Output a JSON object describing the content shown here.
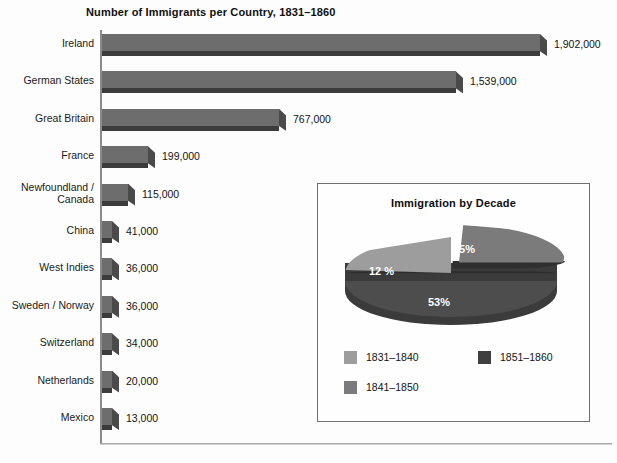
{
  "chart_data": [
    {
      "type": "bar",
      "orientation": "horizontal",
      "title": "Number of Immigrants per Country, 1831–1860",
      "xlabel": "",
      "ylabel": "",
      "grid": false,
      "legend": "none",
      "xlim": [
        0,
        1902000
      ],
      "categories": [
        "Ireland",
        "German States",
        "Great Britain",
        "France",
        "Newfoundland /\nCanada",
        "China",
        "West Indies",
        "Sweden / Norway",
        "Switzerland",
        "Netherlands",
        "Mexico"
      ],
      "values": [
        1902000,
        1539000,
        767000,
        199000,
        115000,
        41000,
        36000,
        36000,
        34000,
        20000,
        13000
      ],
      "value_labels": [
        "1,902,000",
        "1,539,000",
        "767,000",
        "199,000",
        "115,000",
        "41,000",
        "36,000",
        "36,000",
        "34,000",
        "20,000",
        "13,000"
      ],
      "bar_color": "#6d6d6d",
      "bar_shadow_color": "#3c3c3c"
    },
    {
      "type": "pie",
      "title": "Immigration by Decade",
      "labels": [
        "1831–1840",
        "1841–1850",
        "1851–1860"
      ],
      "values": [
        12,
        35,
        53
      ],
      "value_labels": [
        "12 %",
        "35%",
        "53%"
      ],
      "colors": [
        "#9d9d9d",
        "#7b7b7b",
        "#3f3f3f"
      ],
      "exploded_slice": "1841–1850",
      "legend": "bottom",
      "legend_order": [
        "1831–1840",
        "1851–1860",
        "1841–1850"
      ]
    }
  ],
  "bar_chart": {
    "title": "Number of Immigrants per Country, 1831–1860",
    "rows": [
      {
        "label": "Ireland",
        "value": 1902000,
        "value_label": "1,902,000"
      },
      {
        "label": "German States",
        "value": 1539000,
        "value_label": "1,539,000"
      },
      {
        "label": "Great Britain",
        "value": 767000,
        "value_label": "767,000"
      },
      {
        "label": "France",
        "value": 199000,
        "value_label": "199,000"
      },
      {
        "label": "Newfoundland /\nCanada",
        "value": 115000,
        "value_label": "115,000"
      },
      {
        "label": "China",
        "value": 41000,
        "value_label": "41,000"
      },
      {
        "label": "West Indies",
        "value": 36000,
        "value_label": "36,000"
      },
      {
        "label": "Sweden / Norway",
        "value": 36000,
        "value_label": "36,000"
      },
      {
        "label": "Switzerland",
        "value": 34000,
        "value_label": "34,000"
      },
      {
        "label": "Netherlands",
        "value": 20000,
        "value_label": "20,000"
      },
      {
        "label": "Mexico",
        "value": 13000,
        "value_label": "13,000"
      }
    ]
  },
  "inset": {
    "title": "Immigration by Decade",
    "pie": {
      "slices": [
        {
          "label": "1831–1840",
          "percent": 12,
          "percent_label": "12 %",
          "color": "#9d9d9d"
        },
        {
          "label": "1841–1850",
          "percent": 35,
          "percent_label": "35%",
          "color": "#7b7b7b"
        },
        {
          "label": "1851–1860",
          "percent": 53,
          "percent_label": "53%",
          "color": "#3f3f3f"
        }
      ]
    },
    "legend": [
      {
        "label": "1831–1840",
        "color": "#9d9d9d"
      },
      {
        "label": "1841–1850",
        "color": "#7b7b7b"
      },
      {
        "label": "1851–1860",
        "color": "#3f3f3f"
      }
    ]
  }
}
